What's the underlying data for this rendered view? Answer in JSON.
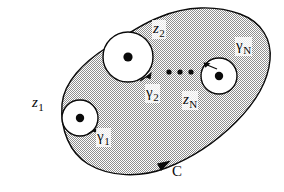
{
  "figure": {
    "type": "complex-contour-diagram",
    "colors": {
      "ink": "#0a0a0a",
      "stipple_fill": "#b9b9b9",
      "hole_fill": "#ffffff",
      "background": "#ffffff"
    },
    "outer_contour": {
      "label": "C",
      "orientation": "counterclockwise",
      "arrow_position": "bottom",
      "label_position": "bottom-center-right"
    },
    "singularities": [
      {
        "point_label": "z",
        "point_subscript": "1",
        "contour_label": "γ",
        "contour_subscript": "1",
        "cx": 80,
        "cy": 118,
        "r": 18,
        "point_label_x": 33,
        "point_label_y": 97,
        "contour_label_x": 95,
        "contour_label_y": 130,
        "arrow_angle_deg": 35
      },
      {
        "point_label": "z",
        "point_subscript": "2",
        "contour_label": "γ",
        "contour_subscript": "2",
        "cx": 128,
        "cy": 57,
        "r": 25,
        "point_label_x": 153,
        "point_label_y": 23,
        "contour_label_x": 144,
        "contour_label_y": 86,
        "arrow_angle_deg": 40
      },
      {
        "point_label": "z",
        "point_subscript": "N",
        "contour_label": "γ",
        "contour_subscript": "N",
        "cx": 219,
        "cy": 76,
        "r": 18,
        "point_label_x": 183,
        "point_label_y": 93,
        "contour_label_x": 236,
        "contour_label_y": 40,
        "arrow_angle_deg": 118
      }
    ],
    "ellipsis": {
      "dots": 3,
      "x_positions": [
        169,
        180,
        191
      ],
      "y": 72,
      "radius": 2.6
    }
  }
}
